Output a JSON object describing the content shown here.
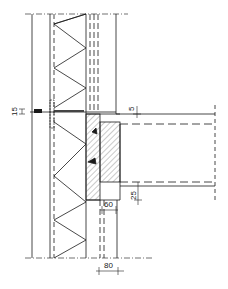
{
  "drawing": {
    "type": "construction section detail",
    "line_color": "#1a1a1a",
    "hatch_color": "#555555",
    "dimensions": {
      "membrane_thickness": "15",
      "slab_top_offset": "5",
      "slab_bottom_offset": "25",
      "inner_gap": "60",
      "bottom_gap": "80"
    }
  }
}
